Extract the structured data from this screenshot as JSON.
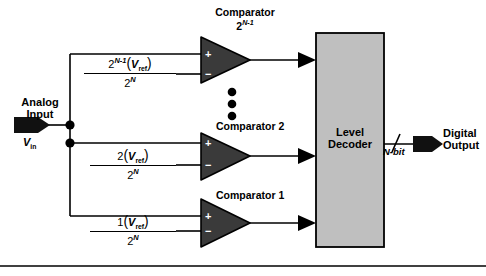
{
  "diagram": {
    "background_color": "#ffffff",
    "line_color": "#000000",
    "comparator_fill": "#3a3a3a",
    "decoder_fill": "#bfbfbf",
    "arrow_fill": "#111111"
  },
  "input": {
    "label_line1": "Analog",
    "label_line2": "Input",
    "signal_name": "V",
    "signal_sub": "in",
    "icon": "input-arrow-icon"
  },
  "comparators": [
    {
      "name": "comparator-top",
      "label_line1": "Comparator",
      "label_base": "2",
      "label_exp": "N-1",
      "plus": "+",
      "minus": "−"
    },
    {
      "name": "comparator-2",
      "label_line1": "Comparator 2",
      "label_base": "",
      "label_exp": "",
      "plus": "+",
      "minus": "−"
    },
    {
      "name": "comparator-1",
      "label_line1": "Comparator 1",
      "label_base": "",
      "label_exp": "",
      "plus": "+",
      "minus": "−"
    }
  ],
  "reference_fractions": [
    {
      "name": "vref-fraction-top",
      "numerator_coef": "2",
      "numerator_exp": "N-1",
      "numerator_var": "V",
      "numerator_var_sub": "ref",
      "denominator_base": "2",
      "denominator_exp": "N"
    },
    {
      "name": "vref-fraction-middle",
      "numerator_coef": "2",
      "numerator_exp": "",
      "numerator_var": "V",
      "numerator_var_sub": "ref",
      "denominator_base": "2",
      "denominator_exp": "N"
    },
    {
      "name": "vref-fraction-bottom",
      "numerator_coef": "1",
      "numerator_exp": "",
      "numerator_var": "V",
      "numerator_var_sub": "ref",
      "denominator_base": "2",
      "denominator_exp": "N"
    }
  ],
  "ellipsis": {
    "name": "vertical-ellipsis",
    "dot_count": 3
  },
  "decoder": {
    "label_line1": "Level",
    "label_line2": "Decoder"
  },
  "output": {
    "bus_label": "N-bit",
    "label_line1": "Digital",
    "label_line2": "Output",
    "icon": "output-arrow-icon"
  }
}
